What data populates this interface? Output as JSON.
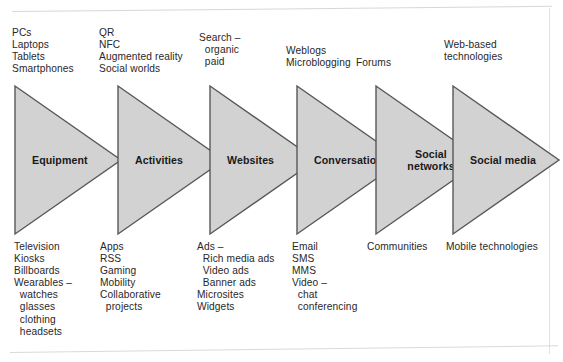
{
  "diagram": {
    "fill_color": "#d2d2d2",
    "stroke_color": "#58585a",
    "stages": [
      {
        "id": "equipment",
        "label": "Equipment",
        "top_items": "PCs\nLaptops\nTablets\nSmartphones",
        "bottom_items": "Television\nKiosks\nBillboards\nWearables –\n  watches\n  glasses\n  clothing\n  headsets"
      },
      {
        "id": "activities",
        "label": "Activities",
        "top_items": "QR\nNFC\nAugmented reality\nSocial worlds",
        "bottom_items": "Apps\nRSS\nGaming\nMobility\nCollaborative\n  projects"
      },
      {
        "id": "websites",
        "label": "Websites",
        "top_items": "Search –\n  organic\n  paid",
        "bottom_items": "Ads –\n  Rich media ads\n  Video ads\n  Banner ads\nMicrosites\nWidgets"
      },
      {
        "id": "conversations",
        "label": "Conversations",
        "top_items": "Weblogs\nMicroblogging",
        "bottom_items": "Email\nSMS\nMMS\nVideo –\n  chat\n  conferencing"
      },
      {
        "id": "social-networks",
        "label": "Social\nnetworks",
        "top_items": "Forums",
        "bottom_items": "Communities"
      },
      {
        "id": "social-media",
        "label": "Social media",
        "top_items": "Web-based\ntechnologies",
        "bottom_items": "Mobile technologies"
      }
    ]
  }
}
